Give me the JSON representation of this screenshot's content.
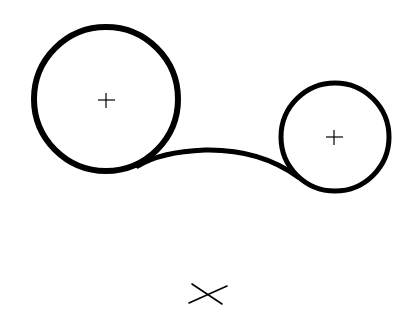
{
  "diagram": {
    "colors": {
      "stroke": "#000000",
      "background": "#ffffff"
    },
    "circles": [
      {
        "name": "large-circle",
        "cx": 106,
        "cy": 99,
        "r": 72,
        "center_mark": "+"
      },
      {
        "name": "small-circle",
        "cx": 335,
        "cy": 137,
        "r": 54,
        "center_mark": "+"
      }
    ],
    "connector": {
      "type": "arc",
      "from": [
        140,
        164
      ],
      "to": [
        296,
        176
      ],
      "peak_y": 150
    },
    "cross_mark": {
      "x": 208,
      "y": 295,
      "symbol": "×"
    }
  }
}
